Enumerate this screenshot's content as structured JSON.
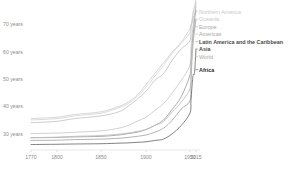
{
  "chart_data": {
    "type": "line",
    "title": "",
    "subtitle": "",
    "xlabel": "",
    "ylabel": "",
    "xlim": [
      1770,
      2015
    ],
    "ylim": [
      24,
      76
    ],
    "grid": false,
    "legend_position": "right-inline",
    "ytick_labels": [
      "70 years",
      "60 years",
      "50 years",
      "40 years",
      "30 years"
    ],
    "ytick_values": [
      70,
      60,
      50,
      40,
      30
    ],
    "xtick_labels": [
      "1770",
      "1800",
      "1850",
      "1900",
      "1950",
      "2015"
    ],
    "xtick_values": [
      1770,
      1800,
      1850,
      1900,
      1950,
      2015
    ],
    "series": [
      {
        "name": "Northern America",
        "color": "#d0d0d0",
        "label_tone": "dim",
        "x": [
          1770,
          1800,
          1820,
          1850,
          1870,
          1880,
          1890,
          1900,
          1910,
          1920,
          1930,
          1940,
          1950,
          1960,
          1970,
          1980,
          1990,
          2000,
          2015
        ],
        "values": [
          35.5,
          36.0,
          37.0,
          38.0,
          40.0,
          41.5,
          44.0,
          48.0,
          52.0,
          56.0,
          60.0,
          63.5,
          68.5,
          70.0,
          71.0,
          74.0,
          75.5,
          77.0,
          79.2
        ]
      },
      {
        "name": "Oceania",
        "color": "#d6d6d6",
        "label_tone": "dim",
        "x": [
          1770,
          1800,
          1820,
          1850,
          1870,
          1880,
          1890,
          1900,
          1910,
          1920,
          1930,
          1940,
          1950,
          1960,
          1970,
          1980,
          1990,
          2000,
          2015
        ],
        "values": [
          35.0,
          35.5,
          36.5,
          37.5,
          39.5,
          41.0,
          43.5,
          47.0,
          51.0,
          55.0,
          59.5,
          63.0,
          67.0,
          69.5,
          70.5,
          73.0,
          75.0,
          76.5,
          78.3
        ]
      },
      {
        "name": "Europe",
        "color": "#c4c4c4",
        "label_tone": "mid",
        "x": [
          1770,
          1800,
          1820,
          1850,
          1870,
          1880,
          1890,
          1900,
          1910,
          1920,
          1930,
          1940,
          1950,
          1960,
          1970,
          1980,
          1990,
          2000,
          2015
        ],
        "values": [
          34.0,
          34.5,
          35.5,
          36.5,
          38.0,
          40.0,
          42.5,
          45.5,
          49.5,
          52.0,
          57.0,
          61.0,
          64.0,
          69.0,
          70.5,
          72.0,
          73.0,
          73.5,
          77.8
        ]
      },
      {
        "name": "Americas",
        "color": "#c9c9c9",
        "label_tone": "mid",
        "x": [
          1770,
          1800,
          1820,
          1850,
          1870,
          1880,
          1890,
          1900,
          1910,
          1920,
          1930,
          1940,
          1950,
          1960,
          1970,
          1980,
          1990,
          2000,
          2015
        ],
        "values": [
          30.0,
          30.2,
          30.5,
          31.0,
          32.0,
          33.0,
          34.5,
          36.0,
          38.5,
          41.0,
          45.0,
          49.5,
          55.0,
          61.0,
          65.0,
          68.5,
          71.5,
          73.5,
          76.5
        ]
      },
      {
        "name": "Latin America and the Caribbean",
        "color": "#9e9e9e",
        "label_tone": "strong",
        "x": [
          1770,
          1800,
          1820,
          1850,
          1870,
          1880,
          1890,
          1900,
          1910,
          1920,
          1930,
          1940,
          1950,
          1960,
          1970,
          1980,
          1990,
          2000,
          2015
        ],
        "values": [
          28.5,
          28.6,
          28.8,
          29.0,
          29.5,
          30.0,
          30.5,
          31.5,
          33.0,
          35.0,
          39.0,
          43.5,
          51.5,
          56.5,
          61.0,
          65.0,
          68.5,
          72.0,
          75.3
        ]
      },
      {
        "name": "Asia",
        "color": "#a5a5a5",
        "label_tone": "strong",
        "x": [
          1770,
          1800,
          1820,
          1850,
          1870,
          1880,
          1890,
          1900,
          1910,
          1920,
          1930,
          1940,
          1950,
          1960,
          1970,
          1980,
          1990,
          2000,
          2015
        ],
        "values": [
          27.5,
          27.6,
          27.8,
          28.0,
          28.3,
          28.6,
          29.0,
          29.5,
          30.5,
          32.0,
          35.0,
          39.0,
          42.0,
          48.0,
          56.0,
          62.0,
          66.0,
          69.0,
          72.0
        ]
      },
      {
        "name": "World",
        "color": "#bdbdbd",
        "label_tone": "mid",
        "x": [
          1770,
          1800,
          1820,
          1850,
          1870,
          1880,
          1890,
          1900,
          1910,
          1920,
          1930,
          1940,
          1950,
          1960,
          1970,
          1980,
          1990,
          2000,
          2015
        ],
        "values": [
          28.5,
          28.7,
          29.0,
          29.3,
          29.8,
          30.2,
          30.8,
          31.5,
          33.0,
          34.5,
          38.0,
          41.5,
          46.5,
          52.5,
          58.5,
          62.5,
          65.5,
          67.5,
          71.8
        ]
      },
      {
        "name": "Africa",
        "color": "#6b6b6b",
        "label_tone": "dark",
        "x": [
          1770,
          1800,
          1820,
          1850,
          1870,
          1880,
          1890,
          1900,
          1910,
          1920,
          1930,
          1940,
          1950,
          1960,
          1970,
          1980,
          1985,
          1990,
          1995,
          2000,
          2005,
          2015
        ],
        "values": [
          26.0,
          26.1,
          26.2,
          26.3,
          26.5,
          26.6,
          26.8,
          27.0,
          27.5,
          28.0,
          30.0,
          33.0,
          37.5,
          42.0,
          46.5,
          50.5,
          51.5,
          51.8,
          51.6,
          52.5,
          55.0,
          61.0
        ]
      }
    ]
  },
  "legend": {
    "entries": [
      {
        "label": "Northern America"
      },
      {
        "label": "Oceania"
      },
      {
        "label": "Europe"
      },
      {
        "label": "Americas"
      },
      {
        "label": "Latin America and the Caribbean"
      },
      {
        "label": "Asia"
      },
      {
        "label": "World"
      },
      {
        "label": "Africa"
      }
    ]
  },
  "colors": {
    "background": "#ffffff",
    "axis": "#d8d8d8",
    "tick_text": "#8c8c8c"
  }
}
